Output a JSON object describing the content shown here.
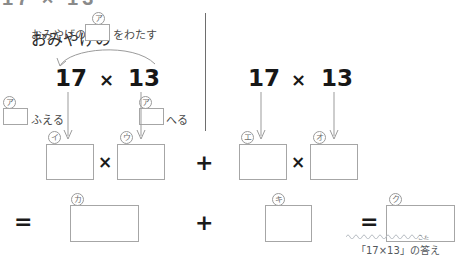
{
  "page": {
    "top_cutoff_text": "17 × 13",
    "divider": "vertical-rule"
  },
  "instruction": {
    "prefix": "おみやげの",
    "box_label": "ア",
    "suffix": "をわたす"
  },
  "left_group": {
    "expression": {
      "left_number": "17",
      "operator": "×",
      "right_number": "13"
    },
    "hint_increase": {
      "box_label": "ア",
      "text": "ふえる"
    },
    "hint_decrease": {
      "box_label": "ア",
      "text": "へる"
    },
    "product_row": {
      "first_box_label": "イ",
      "operator": "×",
      "second_box_label": "ウ"
    },
    "result_row": {
      "equals": "=",
      "box_label": "カ"
    }
  },
  "middle_operators": {
    "upper_plus": "+",
    "lower_plus": "+"
  },
  "right_group": {
    "expression": {
      "left_number": "17",
      "operator": "×",
      "right_number": "13"
    },
    "product_row": {
      "first_box_label": "エ",
      "operator": "×",
      "second_box_label": "オ"
    },
    "result_row": {
      "box_label": "キ"
    }
  },
  "final": {
    "equals": "=",
    "box_label": "ク",
    "caption": "「17×13」の答え",
    "caption_ruby": "こた"
  },
  "colors": {
    "box_border": "#a6a6a6",
    "label_border": "#9a9a9a",
    "text": "#4a4a4a",
    "number": "#171717",
    "divider": "#6e6e6e",
    "wavy": "#b9bec4"
  }
}
